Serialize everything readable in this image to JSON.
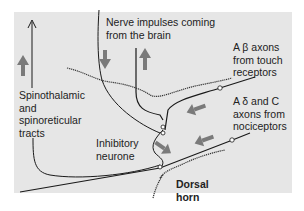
{
  "figure": {
    "type": "gate-control-diagram",
    "background_color": "#e6e6e6",
    "arrow_color": "#7a7a7a",
    "line_color": "#1a1a1a"
  },
  "labels": {
    "nerve_impulses": [
      "Nerve impulses coming",
      "from the brain"
    ],
    "a_beta": [
      "A β axons",
      "from touch",
      "receptors"
    ],
    "a_delta_c": [
      "A δ and C",
      "axons from",
      "nociceptors"
    ],
    "tracts": [
      "Spinothalamic",
      "and",
      "spinoreticular",
      "tracts"
    ],
    "inhibitory": [
      "Inhibitory",
      "neurone"
    ],
    "dorsal_horn": [
      "Dorsal",
      "horn"
    ]
  },
  "arrows": [
    {
      "name": "descending-arrow",
      "direction": "down"
    },
    {
      "name": "ascending-arrow-brain",
      "direction": "up"
    },
    {
      "name": "ascending-arrow-tract",
      "direction": "up"
    },
    {
      "name": "a-beta-input-arrow",
      "direction": "left"
    },
    {
      "name": "a-delta-input-arrow",
      "direction": "left"
    },
    {
      "name": "inhibitory-arrow",
      "direction": "down-right"
    }
  ]
}
